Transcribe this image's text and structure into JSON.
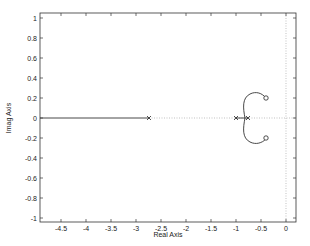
{
  "chart_data": {
    "type": "scatter",
    "title": "",
    "subtitle": "",
    "xlabel": "Real Axis",
    "ylabel": "Imag Axis",
    "xlim": [
      -4.92,
      0.2
    ],
    "ylim": [
      -1.05,
      1.05
    ],
    "grid": false,
    "legend": null,
    "x_ticks": [
      -4.5,
      -4,
      -3.5,
      -3,
      -2.5,
      -2,
      -1.5,
      -1,
      -0.5,
      0
    ],
    "x_tick_labels": [
      "-4.5",
      "-4",
      "-3.5",
      "-3",
      "-2.5",
      "-2",
      "-1.5",
      "-1",
      "-0.5",
      "0"
    ],
    "y_ticks": [
      1,
      0.8,
      0.6,
      0.4,
      0.2,
      0,
      -0.2,
      -0.4,
      -0.6,
      -0.8,
      -1
    ],
    "y_tick_labels": [
      "1",
      "0.8",
      "0.6",
      "0.4",
      "0.2",
      "0",
      "-0.2",
      "-0.4",
      "-0.6",
      "-0.8",
      "-1"
    ],
    "poles": [
      {
        "real": -2.74,
        "imag": 0
      },
      {
        "real": -1.0,
        "imag": 0
      },
      {
        "real": -0.76,
        "imag": 0
      }
    ],
    "zeros": [
      {
        "real": -0.4,
        "imag": 0.2
      },
      {
        "real": -0.4,
        "imag": -0.2
      }
    ],
    "series": [
      {
        "name": "real-axis-branch",
        "style": "solid",
        "x": [
          -4.92,
          -2.74
        ],
        "y": [
          0,
          0
        ]
      },
      {
        "name": "real-axis-segment",
        "style": "solid",
        "x": [
          -1.0,
          -0.76
        ],
        "y": [
          0,
          0
        ]
      },
      {
        "name": "upper-branch",
        "style": "solid",
        "x": [
          -0.82,
          -0.84,
          -0.8,
          -0.7,
          -0.58,
          -0.48,
          -0.4
        ],
        "y": [
          0,
          0.1,
          0.2,
          0.25,
          0.25,
          0.23,
          0.2
        ]
      },
      {
        "name": "lower-branch",
        "style": "solid",
        "x": [
          -0.82,
          -0.84,
          -0.8,
          -0.7,
          -0.58,
          -0.48,
          -0.4
        ],
        "y": [
          0,
          -0.1,
          -0.2,
          -0.25,
          -0.25,
          -0.23,
          -0.2
        ]
      }
    ],
    "reference_lines": [
      {
        "orientation": "horizontal",
        "value": 0,
        "style": "dotted"
      },
      {
        "orientation": "vertical",
        "value": 0,
        "style": "dotted"
      }
    ]
  }
}
